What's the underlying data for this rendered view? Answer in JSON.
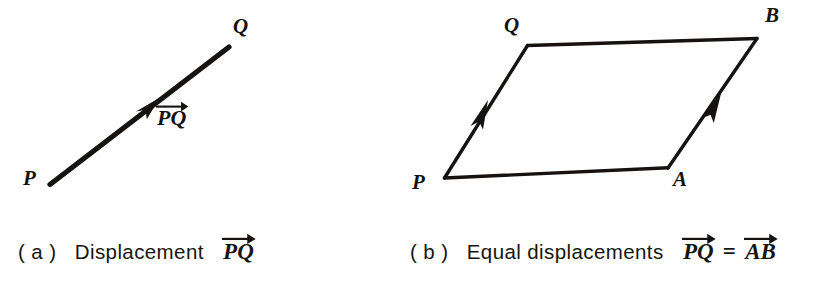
{
  "figure": {
    "background_color": "#ffffff",
    "ink_color": "#15120f",
    "panels": [
      {
        "id": "a",
        "caption_prefix": "( a )",
        "caption_text": "Displacement",
        "caption_vectors": [
          "PQ"
        ],
        "diagram_type": "single-displacement-vector",
        "points": [
          {
            "label": "P",
            "x": 25,
            "y": 170
          },
          {
            "label": "Q",
            "x": 234,
            "y": 18
          }
        ],
        "vector_label": "PQ",
        "vector_label_x": 157,
        "vector_label_y": 110,
        "segments": [
          {
            "name": "PQ",
            "from": [
              50,
              184
            ],
            "to": [
              229,
              47
            ],
            "arrow_at_mid": true
          }
        ]
      },
      {
        "id": "b",
        "caption_prefix": "( b )",
        "caption_text": "Equal displacements",
        "caption_vectors": [
          "PQ",
          "AB"
        ],
        "caption_relation": "=",
        "diagram_type": "parallelogram-equal-vectors",
        "points": [
          {
            "label": "P",
            "x": 414,
            "y": 174
          },
          {
            "label": "Q",
            "x": 505,
            "y": 17
          },
          {
            "label": "B",
            "x": 766,
            "y": 6
          },
          {
            "label": "A",
            "x": 674,
            "y": 171
          }
        ],
        "segments": [
          {
            "name": "PQ",
            "from": [
              444,
              178
            ],
            "to": [
              527,
              45
            ],
            "arrow_at_mid": true
          },
          {
            "name": "QB",
            "from": [
              527,
              45
            ],
            "to": [
              757,
              38
            ],
            "arrow_at_mid": false
          },
          {
            "name": "AB",
            "from": [
              668,
              168
            ],
            "to": [
              757,
              38
            ],
            "arrow_at_mid": true
          },
          {
            "name": "PA",
            "from": [
              444,
              178
            ],
            "to": [
              668,
              168
            ],
            "arrow_at_mid": false
          }
        ]
      }
    ]
  },
  "captions": {
    "a": {
      "prefix": "( a )",
      "word": "Displacement",
      "vector1": "PQ"
    },
    "b": {
      "prefix": "( b )",
      "word": "Equal displacements",
      "vector1": "PQ",
      "relation": "=",
      "vector2": "AB"
    }
  },
  "labels": {
    "a_point_p": "P",
    "a_point_q": "Q",
    "a_vector": "PQ",
    "b_point_p": "P",
    "b_point_q": "Q",
    "b_point_a": "A",
    "b_point_b": "B"
  }
}
